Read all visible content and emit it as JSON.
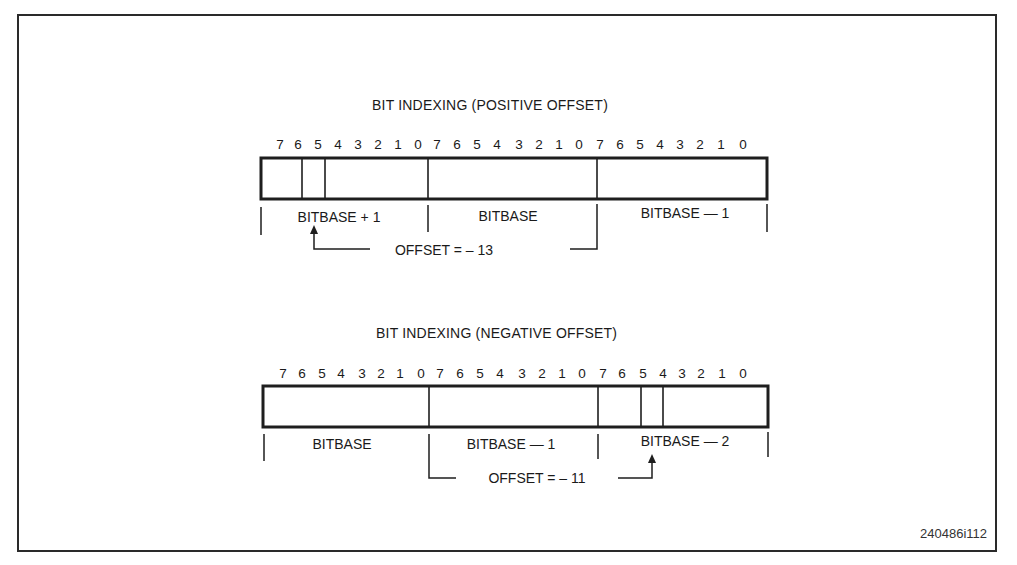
{
  "figure_id": "240486i112",
  "diagrams": [
    {
      "title": "BIT INDEXING (POSITIVE OFFSET)",
      "bit_labels": [
        "7",
        "6",
        "5",
        "4",
        "3",
        "2",
        "1",
        "0",
        "7",
        "6",
        "5",
        "4",
        "3",
        "2",
        "1",
        "0",
        "7",
        "6",
        "5",
        "4",
        "3",
        "2",
        "1",
        "0"
      ],
      "bytes": [
        "BITBASE + 1",
        "BITBASE",
        "BITBASE — 1"
      ],
      "highlighted_bit": {
        "byte": "BITBASE + 1",
        "bit": 5
      },
      "offset_label": "OFFSET = – 13"
    },
    {
      "title": "BIT INDEXING (NEGATIVE OFFSET)",
      "bit_labels": [
        "7",
        "6",
        "5",
        "4",
        "3",
        "2",
        "1",
        "0",
        "7",
        "6",
        "5",
        "4",
        "3",
        "2",
        "1",
        "0",
        "7",
        "6",
        "5",
        "4",
        "3",
        "2",
        "1",
        "0"
      ],
      "bytes": [
        "BITBASE",
        "BITBASE — 1",
        "BITBASE — 2"
      ],
      "highlighted_bit": {
        "byte": "BITBASE — 2",
        "bit": 5
      },
      "offset_label": "OFFSET = – 11"
    }
  ]
}
